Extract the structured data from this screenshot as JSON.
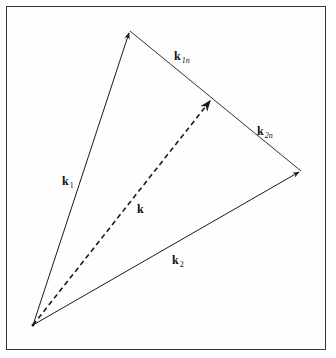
{
  "figure": {
    "points": {
      "origin": [
        33,
        325
      ],
      "apex": [
        130,
        31
      ],
      "right": [
        301,
        171
      ],
      "k_tip": [
        212,
        99
      ]
    },
    "vectors": [
      {
        "id": "k1",
        "from": "origin",
        "to": "apex",
        "style": "solid",
        "label": "k",
        "subscript": "1"
      },
      {
        "id": "k2",
        "from": "origin",
        "to": "right",
        "style": "solid",
        "label": "k",
        "subscript": "2"
      },
      {
        "id": "k",
        "from": "origin",
        "to": "k_tip",
        "style": "dashed",
        "label": "k",
        "subscript": ""
      }
    ],
    "segments": [
      {
        "id": "k1n",
        "from": "apex",
        "to": "k_tip",
        "label": "k",
        "subscript": "1n"
      },
      {
        "id": "k2n",
        "from": "k_tip",
        "to": "right",
        "label": "k",
        "subscript": "2n"
      }
    ],
    "labels": {
      "k1": {
        "main": "k",
        "sub": "1"
      },
      "k2": {
        "main": "k",
        "sub": "2"
      },
      "k": {
        "main": "k",
        "sub": ""
      },
      "k1n": {
        "main": "k",
        "sub": "1n"
      },
      "k2n": {
        "main": "k",
        "sub": "2n"
      }
    },
    "colors": {
      "line": "#1a1a1a",
      "frame": "#333333",
      "background": "#ffffff"
    }
  }
}
